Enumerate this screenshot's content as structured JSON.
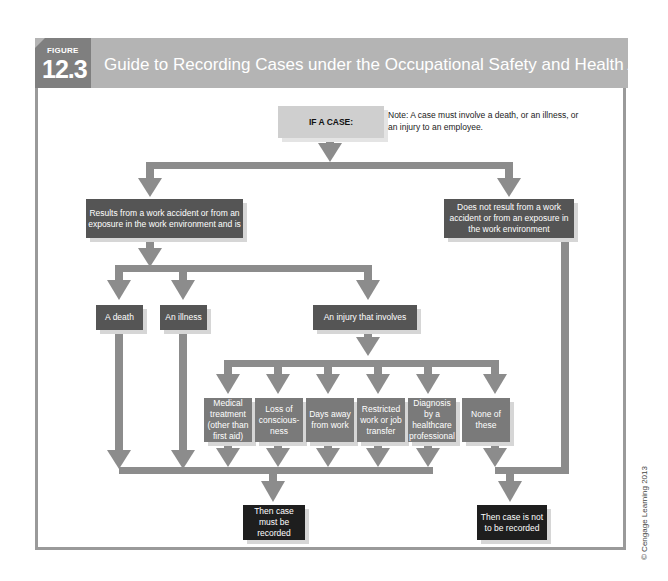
{
  "figure": {
    "label": "FIGURE",
    "number": "12.3",
    "title": "Guide to Recording Cases under the Occupational Safety and Health Act"
  },
  "colors": {
    "header_bg": "#b4b4b4",
    "tab_bg": "#7f7f7f",
    "arrow": "#8c8c8c",
    "box_dark": "#555555",
    "box_mid": "#7a7a7a",
    "box_black": "#1e1e1e",
    "box_light": "#cfcfcf"
  },
  "flow": {
    "start": "IF A CASE:",
    "note": "Note: A case must involve a death, or an illness, or an injury to an employee.",
    "work_related": "Results from a work accident or from an exposure in the work environment and is",
    "not_work_related": "Does not result from a work accident or from an exposure in the work environment",
    "outcomes": {
      "death": "A death",
      "illness": "An illness",
      "injury": "An injury that involves"
    },
    "injury_types": [
      "Medical treatment (other than first aid)",
      "Loss of conscious-ness",
      "Days away from work",
      "Restricted work or job transfer",
      "Diagnosis by a healthcare professional",
      "None of these"
    ],
    "result_recorded": "Then case must be recorded",
    "result_not_recorded": "Then case is not to be recorded"
  },
  "credit": "© Cengage Learning 2013"
}
